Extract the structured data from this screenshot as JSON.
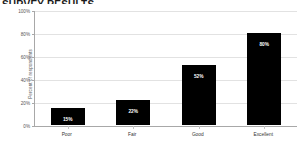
{
  "chart_data": {
    "type": "bar",
    "title": "",
    "categories": [
      "Poor",
      "Fair",
      "Good",
      "Excellent"
    ],
    "values": [
      15,
      22,
      52,
      80
    ],
    "data_labels": [
      "15%",
      "22%",
      "52%",
      "80%"
    ],
    "xlabel": "",
    "ylabel": "Percent of respondents",
    "ylim": [
      0,
      100
    ],
    "ytick_labels": [
      "0%",
      "20%",
      "40%",
      "60%",
      "80%",
      "100%"
    ],
    "ytick_values": [
      0,
      20,
      40,
      60,
      80,
      100
    ],
    "grid": true,
    "legend": false,
    "bar_color": "#000000",
    "grid_color": "#e2e2e2",
    "axis_color": "#a8a8a8"
  },
  "figure": {
    "title_cropped": "SURVEY RESULTS",
    "background": "#ffffff"
  }
}
